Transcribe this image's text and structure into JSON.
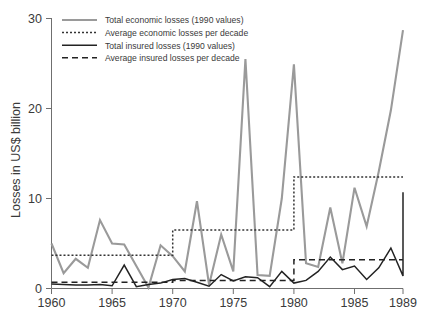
{
  "chart_data": {
    "type": "line",
    "title": "",
    "xlabel": "",
    "ylabel": "Losses in US$ billion",
    "xlim": [
      1960,
      1989
    ],
    "ylim": [
      0,
      30
    ],
    "yticks": [
      0,
      10,
      20,
      30
    ],
    "xticks": [
      1960,
      1965,
      1970,
      1975,
      1980,
      1985,
      1989
    ],
    "grid": false,
    "legend_position": "top-left",
    "x": [
      1960,
      1961,
      1962,
      1963,
      1964,
      1965,
      1966,
      1967,
      1968,
      1969,
      1970,
      1971,
      1972,
      1973,
      1974,
      1975,
      1976,
      1977,
      1978,
      1979,
      1980,
      1981,
      1982,
      1983,
      1984,
      1985,
      1986,
      1987,
      1988,
      1989
    ],
    "series": [
      {
        "name": "Total economic losses (1990 values)",
        "key": "economic_total",
        "color": "#9a9a9a",
        "style": "solid",
        "width": 2.1,
        "values": [
          5.0,
          1.7,
          3.3,
          2.3,
          7.6,
          5.0,
          4.9,
          2.5,
          0.1,
          4.8,
          3.6,
          1.9,
          9.7,
          0.4,
          6.0,
          1.9,
          25.5,
          1.5,
          1.4,
          10.0,
          24.9,
          2.8,
          2.4,
          9.0,
          2.8,
          11.2,
          6.9,
          13.0,
          19.8,
          28.7
        ]
      },
      {
        "name": "Average economic losses per decade",
        "key": "economic_average",
        "color": "#333333",
        "style": "dotted",
        "width": 1.5,
        "decades": [
          {
            "from": 1960,
            "to": 1970,
            "value": 3.7
          },
          {
            "from": 1970,
            "to": 1980,
            "value": 6.5
          },
          {
            "from": 1980,
            "to": 1989,
            "value": 12.4
          }
        ]
      },
      {
        "name": "Total insured losses (1990 values)",
        "key": "insured_total",
        "color": "#232323",
        "style": "solid",
        "width": 1.5,
        "values": [
          0.5,
          0.45,
          0.4,
          0.4,
          0.45,
          0.3,
          2.6,
          0.2,
          0.45,
          0.6,
          1.0,
          1.1,
          0.7,
          0.25,
          1.55,
          0.85,
          1.3,
          1.2,
          0.2,
          1.9,
          0.6,
          0.9,
          1.9,
          3.5,
          2.1,
          2.5,
          1.0,
          2.3,
          4.5,
          1.4
        ]
      },
      {
        "name": "Average insured losses per decade",
        "key": "insured_average",
        "color": "#232323",
        "style": "dashed",
        "width": 1.5,
        "decades": [
          {
            "from": 1960,
            "to": 1970,
            "value": 0.7
          },
          {
            "from": 1970,
            "to": 1980,
            "value": 0.9
          },
          {
            "from": 1980,
            "to": 1989,
            "value": 3.2
          }
        ]
      }
    ],
    "annotations": [
      {
        "note": "Insured losses series ends at 1989 with a sharp rise to 10.7"
      },
      {
        "x": 1989,
        "series": "insured_total",
        "end_value": 10.7
      }
    ]
  },
  "legend": {
    "items": [
      {
        "label": "Total economic losses (1990 values)",
        "swatch": "solid-gray"
      },
      {
        "label": "Average economic losses per decade",
        "swatch": "dotted-black"
      },
      {
        "label": "Total insured losses (1990 values)",
        "swatch": "solid-black"
      },
      {
        "label": "Average insured losses per decade",
        "swatch": "dashed-black"
      }
    ]
  },
  "axes": {
    "y_title": "Losses in US$ billion",
    "y_tick_labels": [
      "0",
      "10",
      "20",
      "30"
    ],
    "x_tick_labels": [
      "1960",
      "1965",
      "1970",
      "1975",
      "1980",
      "1985",
      "1989"
    ]
  },
  "colors": {
    "economic": "#9a9a9a",
    "insured": "#232323",
    "axis": "#6f6f6f",
    "text": "#3a3a3a",
    "background": "#ffffff"
  }
}
